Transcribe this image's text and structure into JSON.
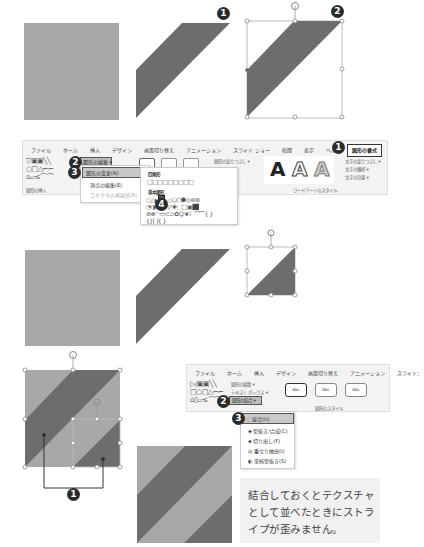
{
  "steps": {
    "top_row": {
      "badge_1": "1",
      "badge_2": "2"
    },
    "ribbon1": {
      "tabs": [
        "ファイル",
        "ホーム",
        "挿入",
        "デザイン",
        "画面切り替え",
        "アニメーション",
        "スライド ショー",
        "校閲",
        "表示",
        "ヘルプ",
        "図形の書式"
      ],
      "active_tab": "図形の書式",
      "active_tab_badge": "1",
      "edit_shape_button": "図形の編集 ▾",
      "edit_shape_badge": "2",
      "change_shape_item": "図形の変更(N)",
      "change_shape_badge": "3",
      "edit_points_item": "頂点の編集(E)",
      "reroute_item": "コネクタの再接続(R)",
      "group_label": "図形の挿入",
      "shape_fill_label": "図形の塗りつぶし ▾",
      "gallery": {
        "rectangles_header": "四角形",
        "basic_shapes_header": "基本図形",
        "selected_badge": "4",
        "rect_row": "□□□□□□□□□",
        "basic_row1": "○△◣▱⏢◇⬠⬡⯃◎⊚⊛",
        "basic_row2": "◔◑▯▭⌐◸✚⬚▢▣⬛",
        "basic_row3": "⊘⊗◠▭⊂⊃✿☺❦☾⌒⌒{ }",
        "basic_row4": "{}[ ]{ }"
      },
      "wordart": {
        "letters": [
          "A",
          "A",
          "A"
        ],
        "text_fill": "文字の塗りつぶし ▾",
        "text_outline": "文字の輪郭 ▾",
        "text_effects": "文字の効果 ▾",
        "group_label": "ワードアートのスタイル"
      }
    },
    "ribbon2": {
      "tabs": [
        "ファイル",
        "ホーム",
        "挿入",
        "デザイン",
        "画面切り替え",
        "アニメーション",
        "スライド："
      ],
      "edit_shape": "図形の編集 ▾",
      "text_box": "テキスト ボックス ▾",
      "merge_shapes": "図形の結合 ▾",
      "merge_badge": "2",
      "union_item": "接合(U)",
      "union_badge": "3",
      "combine_item": "型抜き/合成(C)",
      "fragment_item": "切り出し(F)",
      "intersect_item": "重なり抽出(I)",
      "subtract_item": "単純型抜き(S)",
      "style_buttons": [
        "Abc",
        "Abc",
        "Abc"
      ],
      "group_label": "図形のスタイル"
    },
    "callout_badge": "1"
  },
  "caption": {
    "line1": "結合しておくとテクスチャ",
    "line2": "として並べたときにストラ",
    "line3": "イプが歪みません。"
  },
  "colors": {
    "light_gray": "#a8a8a8",
    "dark_gray": "#6d6d6d",
    "badge": "#2b2b2b",
    "ribbon_bg": "#f3f3f3",
    "caption_bg": "#f1f1f1"
  }
}
